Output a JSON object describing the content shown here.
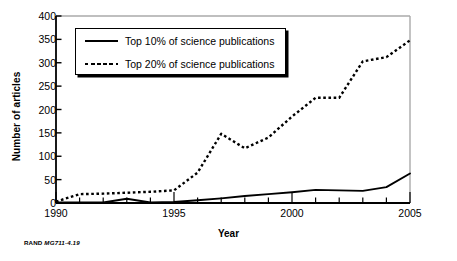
{
  "credit": {
    "org": "RAND",
    "figure_id": "MG711-4.19"
  },
  "legend": {
    "items": [
      {
        "label": "Top 10% of science publications",
        "style": "solid",
        "key_name": "legend-key-solid"
      },
      {
        "label": "Top 20% of science publications",
        "style": "dotted",
        "key_name": "legend-key-dotted"
      }
    ]
  },
  "chart_data": {
    "type": "line",
    "title": "",
    "xlabel": "Year",
    "ylabel": "Number of articles",
    "xlim": [
      1990,
      2005
    ],
    "ylim": [
      0,
      400
    ],
    "grid": false,
    "legend_position": "upper-left-inside",
    "x": [
      1990,
      1991,
      1992,
      1993,
      1994,
      1995,
      1996,
      1997,
      1998,
      1999,
      2000,
      2001,
      2002,
      2003,
      2004,
      2005
    ],
    "xticks": [
      1990,
      1995,
      2000,
      2005
    ],
    "xtick_labels": [
      "1990",
      "1995",
      "2000",
      "2005"
    ],
    "yticks": [
      0,
      50,
      100,
      150,
      200,
      250,
      300,
      350,
      400
    ],
    "ytick_labels": [
      "0",
      "50",
      "100",
      "150",
      "200",
      "250",
      "300",
      "350",
      "400"
    ],
    "series": [
      {
        "name": "Top 10% of science publications",
        "style": "solid",
        "values": [
          1,
          1,
          1,
          9,
          1,
          2,
          6,
          10,
          15,
          19,
          23,
          28,
          27,
          26,
          34,
          63
        ]
      },
      {
        "name": "Top 20% of science publications",
        "style": "dotted",
        "values": [
          3,
          19,
          20,
          22,
          24,
          27,
          65,
          148,
          117,
          140,
          185,
          225,
          225,
          303,
          312,
          348
        ]
      }
    ]
  }
}
